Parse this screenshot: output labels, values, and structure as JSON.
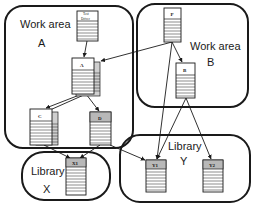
{
  "diagram": {
    "colors": {
      "stroke": "#1a1a1a",
      "paper": "#ffffff",
      "gray_header": "#b8b8b8",
      "shadow": "#cfcfcf"
    },
    "regions": [
      {
        "id": "work-area-a",
        "line1": "Work area",
        "line2": "A"
      },
      {
        "id": "work-area-b",
        "line1": "Work area",
        "line2": "B"
      },
      {
        "id": "library-x",
        "line1": "Library",
        "line2": "X"
      },
      {
        "id": "library-y",
        "line1": "Library",
        "line2": "Y"
      }
    ],
    "documents": [
      {
        "id": "test-driver",
        "line1": "Test",
        "line2": "Driver",
        "region": "work-area-a"
      },
      {
        "id": "doc-a",
        "label": "A",
        "region": "work-area-a"
      },
      {
        "id": "doc-c",
        "label": "C",
        "region": "work-area-a"
      },
      {
        "id": "doc-d",
        "label": "D",
        "region": "work-area-a"
      },
      {
        "id": "doc-p",
        "label": "P",
        "region": "work-area-b"
      },
      {
        "id": "doc-b",
        "label": "B",
        "region": "work-area-b"
      },
      {
        "id": "doc-x1",
        "label": "X1",
        "region": "library-x"
      },
      {
        "id": "doc-y1",
        "label": "Y1",
        "region": "library-y"
      },
      {
        "id": "doc-y2",
        "label": "Y2",
        "region": "library-y"
      }
    ],
    "edges": [
      {
        "from": "test-driver",
        "to": "doc-a"
      },
      {
        "from": "doc-p",
        "to": "doc-a"
      },
      {
        "from": "doc-p",
        "to": "doc-b"
      },
      {
        "from": "doc-p",
        "to": "doc-y1"
      },
      {
        "from": "doc-a",
        "to": "doc-c"
      },
      {
        "from": "doc-a",
        "to": "doc-d"
      },
      {
        "from": "doc-b",
        "to": "doc-y1"
      },
      {
        "from": "doc-b",
        "to": "doc-y2"
      },
      {
        "from": "doc-c",
        "to": "doc-x1"
      },
      {
        "from": "doc-d",
        "to": "doc-x1"
      },
      {
        "from": "doc-c",
        "to": "doc-y1"
      }
    ]
  }
}
